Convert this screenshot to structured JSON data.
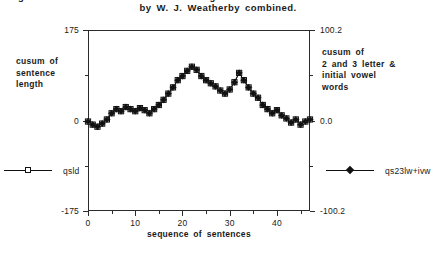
{
  "title": {
    "line1": "Figure 2. Cusum chart of sentence length and 2 & 3 letter + initial vowel words",
    "line2": "by W. J. Weatherby combined."
  },
  "axes": {
    "left": {
      "title": "cusum of sentence length",
      "title_lines": [
        "cusum of",
        "sentence",
        "length"
      ],
      "ticks": [
        "175",
        "0",
        "-175"
      ],
      "tick_values": [
        175,
        0,
        -175
      ],
      "min": -175,
      "max": 175
    },
    "right": {
      "title": "cusum of 2 and 3 letter & initial vowel words",
      "title_lines": [
        "cusum of",
        "2 and 3 letter &",
        "initial vowel",
        "words"
      ],
      "ticks": [
        "100.2",
        "0.0",
        "-100.2"
      ],
      "tick_values": [
        100.2,
        0.0,
        -100.2
      ],
      "min": -100.2,
      "max": 100.2
    },
    "bottom": {
      "title": "sequence of sentences",
      "ticks": [
        "0",
        "10",
        "20",
        "30",
        "40"
      ],
      "tick_values": [
        0,
        10,
        20,
        30,
        40
      ],
      "min": 0,
      "max": 47
    }
  },
  "legend": {
    "left": {
      "label": "qsld",
      "marker": "open-square-icon",
      "color": "#111111"
    },
    "right": {
      "label": "qs23lw+ivw",
      "marker": "filled-diamond-icon",
      "color": "#111111"
    }
  },
  "chart_data": {
    "type": "line",
    "title": "Figure 2. Cusum chart of sentence length and 2 & 3 letter + initial vowel words by W. J. Weatherby combined.",
    "xlabel": "sequence of sentences",
    "ylabel": "cusum of sentence length",
    "ylabel_right": "cusum of 2 and 3 letter & initial vowel words",
    "xlim": [
      0,
      47
    ],
    "ylim": [
      -175,
      175
    ],
    "ylim_right": [
      -100.2,
      100.2
    ],
    "grid": false,
    "legend_position": "outside-bottom-left-and-right",
    "x": [
      0,
      1,
      2,
      3,
      4,
      5,
      6,
      7,
      8,
      9,
      10,
      11,
      12,
      13,
      14,
      15,
      16,
      17,
      18,
      19,
      20,
      21,
      22,
      23,
      24,
      25,
      26,
      27,
      28,
      29,
      30,
      31,
      32,
      33,
      34,
      35,
      36,
      37,
      38,
      39,
      40,
      41,
      42,
      43,
      44,
      45,
      46,
      47
    ],
    "series": [
      {
        "name": "qsld",
        "marker": "open-square-icon",
        "axis": "left",
        "values": [
          -2,
          -8,
          -12,
          -6,
          2,
          14,
          22,
          18,
          26,
          22,
          18,
          24,
          20,
          14,
          22,
          30,
          40,
          52,
          64,
          78,
          86,
          96,
          104,
          98,
          86,
          78,
          72,
          66,
          58,
          52,
          60,
          74,
          92,
          78,
          64,
          52,
          44,
          30,
          22,
          14,
          20,
          10,
          4,
          -4,
          2,
          -8,
          -2,
          2
        ]
      },
      {
        "name": "qs23lw+ivw",
        "marker": "filled-diamond-icon",
        "axis": "right",
        "values": [
          -1.1,
          -4.6,
          -6.9,
          -3.4,
          1.1,
          8.0,
          12.6,
          10.3,
          14.9,
          12.6,
          10.3,
          13.7,
          11.5,
          8.0,
          12.6,
          17.2,
          22.9,
          29.8,
          36.6,
          44.6,
          49.2,
          54.9,
          59.5,
          56.1,
          49.2,
          44.6,
          41.2,
          37.8,
          33.2,
          29.8,
          34.3,
          42.3,
          52.7,
          44.6,
          36.6,
          29.8,
          25.2,
          17.2,
          12.6,
          8.0,
          11.5,
          5.7,
          2.3,
          -2.3,
          1.1,
          -4.6,
          -1.1,
          1.1
        ]
      }
    ]
  }
}
